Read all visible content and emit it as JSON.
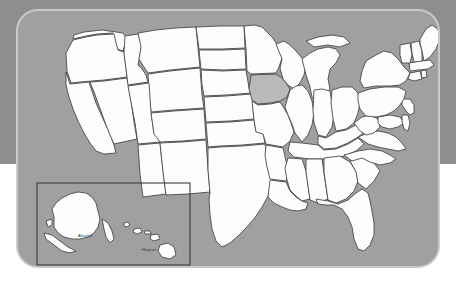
{
  "graphic": {
    "kind": "map",
    "subject": "United States state outline map",
    "highlighted_state": "Iowa",
    "title": "",
    "caption": ""
  },
  "colors": {
    "page_background": "#ffffff",
    "backdrop_band": "#8e8e8e",
    "card_fill": "#a0a0a0",
    "card_border": "#c9c9c9",
    "state_fill": "#fdfdfd",
    "state_stroke": "#4a4a4a",
    "highlight_fill": "#b9b9b9",
    "inset_border": "#3c3c3c",
    "label_text": "#2f2f2f"
  },
  "inset": {
    "name": "alaska-hawaii-inset",
    "labels": [
      {
        "id": "alaska-label",
        "text": "Alaska"
      },
      {
        "id": "hawaii-label",
        "text": "Hawaii"
      }
    ]
  },
  "states": [
    {
      "code": "WA",
      "name": "Washington",
      "highlighted": false
    },
    {
      "code": "OR",
      "name": "Oregon",
      "highlighted": false
    },
    {
      "code": "CA",
      "name": "California",
      "highlighted": false
    },
    {
      "code": "NV",
      "name": "Nevada",
      "highlighted": false
    },
    {
      "code": "ID",
      "name": "Idaho",
      "highlighted": false
    },
    {
      "code": "MT",
      "name": "Montana",
      "highlighted": false
    },
    {
      "code": "WY",
      "name": "Wyoming",
      "highlighted": false
    },
    {
      "code": "UT",
      "name": "Utah",
      "highlighted": false
    },
    {
      "code": "AZ",
      "name": "Arizona",
      "highlighted": false
    },
    {
      "code": "CO",
      "name": "Colorado",
      "highlighted": false
    },
    {
      "code": "NM",
      "name": "New Mexico",
      "highlighted": false
    },
    {
      "code": "ND",
      "name": "North Dakota",
      "highlighted": false
    },
    {
      "code": "SD",
      "name": "South Dakota",
      "highlighted": false
    },
    {
      "code": "NE",
      "name": "Nebraska",
      "highlighted": false
    },
    {
      "code": "KS",
      "name": "Kansas",
      "highlighted": false
    },
    {
      "code": "OK",
      "name": "Oklahoma",
      "highlighted": false
    },
    {
      "code": "TX",
      "name": "Texas",
      "highlighted": false
    },
    {
      "code": "MN",
      "name": "Minnesota",
      "highlighted": false
    },
    {
      "code": "IA",
      "name": "Iowa",
      "highlighted": true
    },
    {
      "code": "MO",
      "name": "Missouri",
      "highlighted": false
    },
    {
      "code": "AR",
      "name": "Arkansas",
      "highlighted": false
    },
    {
      "code": "LA",
      "name": "Louisiana",
      "highlighted": false
    },
    {
      "code": "WI",
      "name": "Wisconsin",
      "highlighted": false
    },
    {
      "code": "IL",
      "name": "Illinois",
      "highlighted": false
    },
    {
      "code": "MI",
      "name": "Michigan",
      "highlighted": false
    },
    {
      "code": "IN",
      "name": "Indiana",
      "highlighted": false
    },
    {
      "code": "OH",
      "name": "Ohio",
      "highlighted": false
    },
    {
      "code": "KY",
      "name": "Kentucky",
      "highlighted": false
    },
    {
      "code": "TN",
      "name": "Tennessee",
      "highlighted": false
    },
    {
      "code": "MS",
      "name": "Mississippi",
      "highlighted": false
    },
    {
      "code": "AL",
      "name": "Alabama",
      "highlighted": false
    },
    {
      "code": "GA",
      "name": "Georgia",
      "highlighted": false
    },
    {
      "code": "FL",
      "name": "Florida",
      "highlighted": false
    },
    {
      "code": "SC",
      "name": "South Carolina",
      "highlighted": false
    },
    {
      "code": "NC",
      "name": "North Carolina",
      "highlighted": false
    },
    {
      "code": "VA",
      "name": "Virginia",
      "highlighted": false
    },
    {
      "code": "WV",
      "name": "West Virginia",
      "highlighted": false
    },
    {
      "code": "MD",
      "name": "Maryland",
      "highlighted": false
    },
    {
      "code": "DE",
      "name": "Delaware",
      "highlighted": false
    },
    {
      "code": "NJ",
      "name": "New Jersey",
      "highlighted": false
    },
    {
      "code": "PA",
      "name": "Pennsylvania",
      "highlighted": false
    },
    {
      "code": "NY",
      "name": "New York",
      "highlighted": false
    },
    {
      "code": "CT",
      "name": "Connecticut",
      "highlighted": false
    },
    {
      "code": "RI",
      "name": "Rhode Island",
      "highlighted": false
    },
    {
      "code": "MA",
      "name": "Massachusetts",
      "highlighted": false
    },
    {
      "code": "VT",
      "name": "Vermont",
      "highlighted": false
    },
    {
      "code": "NH",
      "name": "New Hampshire",
      "highlighted": false
    },
    {
      "code": "ME",
      "name": "Maine",
      "highlighted": false
    },
    {
      "code": "AK",
      "name": "Alaska",
      "highlighted": false
    },
    {
      "code": "HI",
      "name": "Hawaii",
      "highlighted": false
    }
  ]
}
